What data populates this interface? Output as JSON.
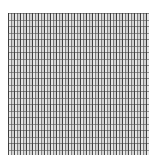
{
  "image": {
    "description": "Grid texture of alternating dark and light vertical stripe bricks",
    "colors": {
      "background": "#ffffff",
      "dark": "#3c3c3c",
      "light": "#e6e6e6",
      "mid": "#8a8a8a"
    }
  }
}
